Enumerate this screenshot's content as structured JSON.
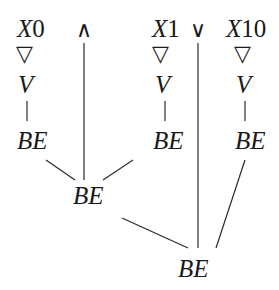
{
  "diagram": {
    "top_row": {
      "x0": {
        "var": "X",
        "index": "0"
      },
      "and_op": "∧",
      "x1": {
        "var": "X",
        "index": "1"
      },
      "or_op": "∨",
      "x10": {
        "var": "X",
        "index": "10"
      }
    },
    "triangle_symbol": "▽",
    "v_label": "V",
    "be_label": "BE",
    "nodes": [
      {
        "id": "x0",
        "label": "X0"
      },
      {
        "id": "and",
        "label": "∧"
      },
      {
        "id": "x1",
        "label": "X1"
      },
      {
        "id": "or",
        "label": "∨"
      },
      {
        "id": "x10",
        "label": "X10"
      },
      {
        "id": "tri0",
        "label": "▽"
      },
      {
        "id": "tri1",
        "label": "▽"
      },
      {
        "id": "tri10",
        "label": "▽"
      },
      {
        "id": "v0",
        "label": "V"
      },
      {
        "id": "v1",
        "label": "V"
      },
      {
        "id": "v10",
        "label": "V"
      },
      {
        "id": "be0",
        "label": "BE"
      },
      {
        "id": "be1",
        "label": "BE"
      },
      {
        "id": "be10",
        "label": "BE"
      },
      {
        "id": "be_and",
        "label": "BE"
      },
      {
        "id": "be_root",
        "label": "BE"
      }
    ],
    "edges": [
      [
        "x0",
        "tri0"
      ],
      [
        "tri0",
        "v0"
      ],
      [
        "v0",
        "be0"
      ],
      [
        "x1",
        "tri1"
      ],
      [
        "tri1",
        "v1"
      ],
      [
        "v1",
        "be1"
      ],
      [
        "x10",
        "tri10"
      ],
      [
        "tri10",
        "v10"
      ],
      [
        "v10",
        "be10"
      ],
      [
        "be0",
        "be_and"
      ],
      [
        "and",
        "be_and"
      ],
      [
        "be1",
        "be_and"
      ],
      [
        "be_and",
        "be_root"
      ],
      [
        "or",
        "be_root"
      ],
      [
        "be10",
        "be_root"
      ]
    ]
  }
}
